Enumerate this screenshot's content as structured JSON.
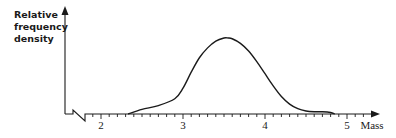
{
  "chart_data": {
    "type": "line",
    "title": "",
    "xlabel": "Mass",
    "ylabel": "Relative frequency density",
    "ylabel_lines": [
      "Relative",
      "frequency",
      "density"
    ],
    "x_ticks": [
      2,
      3,
      4,
      5
    ],
    "x_minor_step": 0.1,
    "xlim": [
      1.75,
      5.3
    ],
    "axis_break": true,
    "grid": false,
    "legend": null,
    "series": [
      {
        "name": "distribution",
        "x": [
          2.33,
          2.5,
          2.7,
          2.9,
          3.0,
          3.1,
          3.2,
          3.3,
          3.4,
          3.5,
          3.55,
          3.6,
          3.7,
          3.8,
          3.9,
          4.0,
          4.1,
          4.2,
          4.3,
          4.4,
          4.5,
          4.6,
          4.7,
          4.8,
          4.85
        ],
        "y": [
          0.0,
          0.06,
          0.11,
          0.2,
          0.34,
          0.55,
          0.74,
          0.87,
          0.96,
          1.0,
          1.0,
          0.99,
          0.93,
          0.83,
          0.69,
          0.53,
          0.37,
          0.23,
          0.13,
          0.07,
          0.04,
          0.03,
          0.03,
          0.02,
          0.0
        ]
      }
    ]
  },
  "labels": {
    "ylabel_1": "Relative",
    "ylabel_2": "frequency",
    "ylabel_3": "density",
    "xlabel": "Mass",
    "tick_2": "2",
    "tick_3": "3",
    "tick_4": "4",
    "tick_5": "5"
  },
  "colors": {
    "ink": "#1a1a1a",
    "background": "#ffffff"
  }
}
